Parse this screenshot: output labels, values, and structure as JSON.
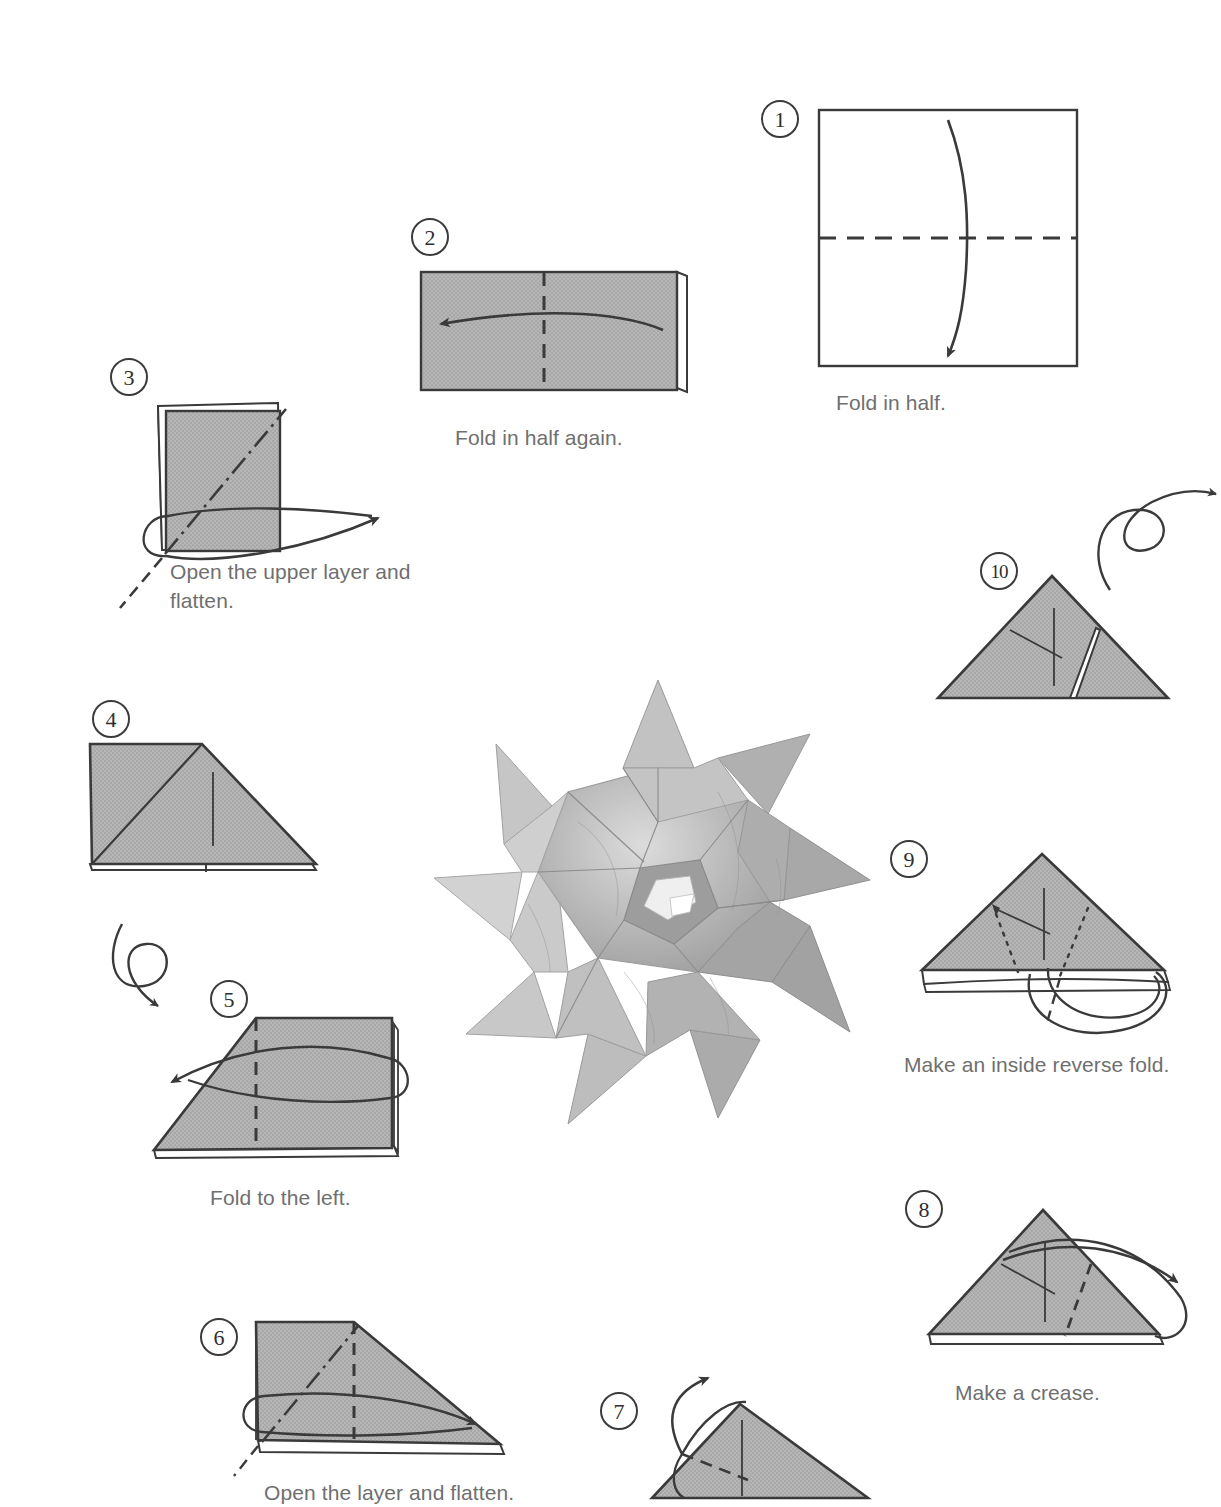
{
  "page": {
    "background": "#ffffff",
    "paper_fill": "#b4b4b4",
    "paper_white": "#ffffff",
    "line_color": "#3a3a3a",
    "caption_color": "#6f6f6f",
    "width": 1207,
    "height": 1498
  },
  "steps": [
    {
      "id": "step-1",
      "number": "1",
      "caption": "Fold in half.",
      "shape": "square-white",
      "fold_line": "horizontal-dashed-center",
      "arrow": "curve-down",
      "turn_over_symbol": false
    },
    {
      "id": "step-2",
      "number": "2",
      "caption": "Fold in half again.",
      "shape": "rectangle-gray",
      "fold_line": "vertical-dashed-center",
      "arrow": "curve-left",
      "turn_over_symbol": false
    },
    {
      "id": "step-3",
      "number": "3",
      "caption": "Open the upper layer and\nflatten.",
      "shape": "square-gray-layered",
      "fold_line": "diagonal-dash-dot",
      "arrow": "curve-right-open",
      "turn_over_symbol": false
    },
    {
      "id": "step-4",
      "number": "4",
      "caption": "",
      "shape": "square-plus-triangle-gray",
      "fold_line": "internal-crease",
      "arrow": "none",
      "turn_over_symbol": false
    },
    {
      "id": "step-5",
      "number": "5",
      "caption": "Fold to the left.",
      "shape": "trapezoid-gray",
      "fold_line": "vertical-dashed",
      "arrow": "curve-left-wrap",
      "turn_over_symbol": true
    },
    {
      "id": "step-6",
      "number": "6",
      "caption": "Open the layer and flatten.",
      "shape": "trapezoid-gray",
      "fold_line": "diagonal-dash-dot-and-vertical-dashed",
      "arrow": "curve-right-open",
      "turn_over_symbol": false
    },
    {
      "id": "step-7",
      "number": "7",
      "caption": "",
      "shape": "triangle-gray",
      "fold_line": "diagonal-dashed",
      "arrow": "curve-up-open",
      "turn_over_symbol": false
    },
    {
      "id": "step-8",
      "number": "8",
      "caption": "Make a crease.",
      "shape": "triangle-gray-layered",
      "fold_line": "diagonal-dashed",
      "arrow": "fold-and-return",
      "turn_over_symbol": false
    },
    {
      "id": "step-9",
      "number": "9",
      "caption": "Make an inside reverse fold.",
      "shape": "triangle-gray-layered",
      "fold_line": "dotted-hidden-lines",
      "arrow": "tuck-inside",
      "turn_over_symbol": false
    },
    {
      "id": "step-10",
      "number": "10",
      "caption": "",
      "shape": "triangle-gray-creased",
      "fold_line": "internal-creases",
      "arrow": "none",
      "turn_over_symbol": true
    }
  ],
  "photo": {
    "name": "finished-model-photo",
    "description": "Finished modular origami star kusudama",
    "alt": "Completed folded paper star ball"
  }
}
